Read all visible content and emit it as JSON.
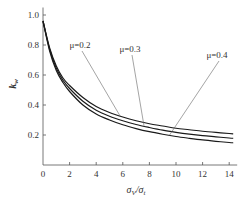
{
  "chart_data": {
    "type": "line",
    "title": "",
    "xlabel": "σV/σt",
    "ylabel": "kw",
    "xlim": [
      0,
      14.6
    ],
    "ylim": [
      0,
      1.05
    ],
    "xticks": [
      0,
      2,
      4,
      6,
      8,
      10,
      12,
      14
    ],
    "yticks": [
      0.2,
      0.4,
      0.6,
      0.8,
      1.0
    ],
    "xtick_labels": [
      "0",
      "2",
      "4",
      "6",
      "8",
      "10",
      "12",
      "14"
    ],
    "ytick_labels": [
      "0.2",
      "0.4",
      "0.6",
      "0.8",
      "1.0"
    ],
    "grid": false,
    "legend": "inline annotations with leader lines",
    "x": [
      0,
      0.5,
      1,
      1.5,
      2,
      3,
      4,
      5,
      6,
      7,
      8,
      9,
      10,
      11,
      12,
      13,
      14,
      14.3
    ],
    "series": [
      {
        "name": "μ=0.2",
        "values": [
          0.96,
          0.78,
          0.66,
          0.58,
          0.53,
          0.45,
          0.39,
          0.35,
          0.32,
          0.295,
          0.275,
          0.26,
          0.245,
          0.235,
          0.225,
          0.217,
          0.21,
          0.208
        ]
      },
      {
        "name": "μ=0.3",
        "values": [
          0.96,
          0.77,
          0.645,
          0.565,
          0.51,
          0.425,
          0.365,
          0.325,
          0.295,
          0.27,
          0.25,
          0.232,
          0.218,
          0.206,
          0.196,
          0.188,
          0.18,
          0.178
        ]
      },
      {
        "name": "μ=0.4",
        "values": [
          0.96,
          0.76,
          0.63,
          0.55,
          0.49,
          0.4,
          0.34,
          0.3,
          0.268,
          0.243,
          0.222,
          0.205,
          0.19,
          0.178,
          0.167,
          0.158,
          0.15,
          0.148
        ]
      }
    ],
    "annotations": [
      {
        "text": "μ=0.2",
        "label_xy": [
          80,
          48
        ],
        "target_series": "μ=0.2",
        "target_x": 5.8
      },
      {
        "text": "μ=0.3",
        "label_xy": [
          130,
          52
        ],
        "target_series": "μ=0.3",
        "target_x": 7.6
      },
      {
        "text": "μ=0.4",
        "label_xy": [
          217,
          58
        ],
        "target_series": "μ=0.4",
        "target_x": 9.5
      }
    ]
  },
  "labels": {
    "y_axis_k": "k",
    "y_axis_sub": "w",
    "x_axis_main": "σ",
    "x_axis_sub1": "V",
    "x_axis_slash": "/σ",
    "x_axis_sub2": "t"
  },
  "colors": {
    "curve": "#1a1a1a",
    "axis": "#555555",
    "leader": "#666666",
    "text": "#333333"
  }
}
